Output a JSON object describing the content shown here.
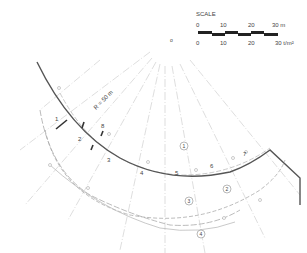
{
  "scale": {
    "title": "SCALE",
    "top_ticks": [
      "0",
      "10",
      "20",
      "30 m"
    ],
    "bottom_ticks": [
      "0",
      "10",
      "20",
      "30 t/m²"
    ]
  },
  "radius_label": "R = 50 m",
  "center_label": "o",
  "station_labels": [
    "1",
    "2",
    "3",
    "4",
    "5",
    "6",
    "7"
  ],
  "marker_label": "8",
  "circled_labels": [
    "1",
    "2",
    "3",
    "4"
  ],
  "colors": {
    "main_line": "#555555",
    "thin_line": "#bbbbbb",
    "dash_line": "#aaaaaa",
    "text": "#444444"
  }
}
